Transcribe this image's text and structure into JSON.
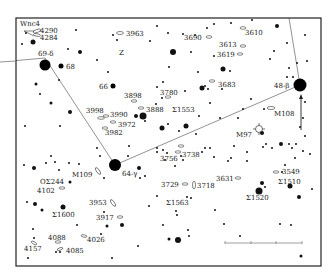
{
  "frame": {
    "x": 16,
    "y": 18,
    "w": 305,
    "h": 248
  },
  "constellation_lines": [
    {
      "from": "69-δ",
      "to": "64-γ",
      "points": [
        [
          0,
          62
        ],
        [
          45,
          58
        ],
        [
          115,
          165
        ]
      ]
    },
    {
      "from": "64-γ",
      "to": "48-β",
      "points": [
        [
          115,
          165
        ],
        [
          300,
          85
        ]
      ]
    },
    {
      "from": "48-β",
      "to": "top",
      "points": [
        [
          300,
          85
        ],
        [
          289,
          18
        ]
      ]
    }
  ],
  "named_stars": [
    {
      "label": "69-δ",
      "x": 45,
      "y": 65,
      "r": 5.5,
      "lx": 38,
      "ly": 56
    },
    {
      "label": "68",
      "x": 61,
      "y": 66,
      "r": 2.5,
      "lx": 66,
      "ly": 69
    },
    {
      "label": "66",
      "x": 113,
      "y": 86,
      "r": 2.5,
      "lx": 99,
      "ly": 89
    },
    {
      "label": "64-γ",
      "x": 115,
      "y": 165,
      "r": 6,
      "lx": 122,
      "ly": 176
    },
    {
      "label": "48-β",
      "x": 300,
      "y": 85,
      "r": 6.5,
      "lx": 274,
      "ly": 88
    }
  ],
  "labels": [
    {
      "text": "Wnc4",
      "x": 20,
      "y": 26
    },
    {
      "text": "4290",
      "x": 40,
      "y": 33
    },
    {
      "text": "4284",
      "x": 40,
      "y": 40
    },
    {
      "text": "3963",
      "x": 126,
      "y": 36
    },
    {
      "text": "Z",
      "x": 119,
      "y": 55
    },
    {
      "text": "3898",
      "x": 124,
      "y": 98
    },
    {
      "text": "3998",
      "x": 86,
      "y": 113
    },
    {
      "text": "3990",
      "x": 110,
      "y": 117
    },
    {
      "text": "3888",
      "x": 146,
      "y": 112
    },
    {
      "text": "3780",
      "x": 160,
      "y": 95
    },
    {
      "text": "Σ1553",
      "x": 172,
      "y": 112
    },
    {
      "text": "3972",
      "x": 118,
      "y": 127
    },
    {
      "text": "3982",
      "x": 105,
      "y": 135
    },
    {
      "text": "3690",
      "x": 184,
      "y": 40
    },
    {
      "text": "3610",
      "x": 245,
      "y": 35
    },
    {
      "text": "3613",
      "x": 219,
      "y": 47
    },
    {
      "text": "3619",
      "x": 217,
      "y": 57
    },
    {
      "text": "3683",
      "x": 218,
      "y": 87
    },
    {
      "text": "M108",
      "x": 274,
      "y": 116
    },
    {
      "text": "M97",
      "x": 236,
      "y": 137
    },
    {
      "text": "3738",
      "x": 182,
      "y": 157
    },
    {
      "text": "3756",
      "x": 160,
      "y": 161
    },
    {
      "text": "3729",
      "x": 161,
      "y": 187
    },
    {
      "text": "3718",
      "x": 197,
      "y": 188
    },
    {
      "text": "3631",
      "x": 216,
      "y": 181
    },
    {
      "text": "3549",
      "x": 282,
      "y": 174
    },
    {
      "text": "Σ1510",
      "x": 278,
      "y": 184
    },
    {
      "text": "Σ1520",
      "x": 246,
      "y": 200
    },
    {
      "text": "Σ1563",
      "x": 166,
      "y": 205
    },
    {
      "text": "M109",
      "x": 72,
      "y": 177
    },
    {
      "text": "OΣ244",
      "x": 40,
      "y": 184
    },
    {
      "text": "4102",
      "x": 37,
      "y": 193
    },
    {
      "text": "3953",
      "x": 89,
      "y": 205
    },
    {
      "text": "Σ1600",
      "x": 52,
      "y": 217
    },
    {
      "text": "3917",
      "x": 96,
      "y": 220
    },
    {
      "text": "4088",
      "x": 48,
      "y": 240
    },
    {
      "text": "4026",
      "x": 87,
      "y": 242
    },
    {
      "text": "4157",
      "x": 24,
      "y": 251
    },
    {
      "text": "4085",
      "x": 66,
      "y": 253
    }
  ],
  "galaxies": [
    {
      "x": 37,
      "y": 31,
      "rx": 4,
      "ry": 1.5,
      "rot": -20
    },
    {
      "x": 37,
      "y": 35,
      "rx": 3.5,
      "ry": 1.3,
      "rot": 10
    },
    {
      "x": 120,
      "y": 33,
      "rx": 3.5,
      "ry": 1.5,
      "rot": 0
    },
    {
      "x": 134,
      "y": 101,
      "rx": 3,
      "ry": 1.2,
      "rot": 0
    },
    {
      "x": 101,
      "y": 118,
      "rx": 3.5,
      "ry": 1.3,
      "rot": 0
    },
    {
      "x": 106,
      "y": 116,
      "rx": 3,
      "ry": 1.2,
      "rot": 0
    },
    {
      "x": 141,
      "y": 108,
      "rx": 3,
      "ry": 1.2,
      "rot": 0
    },
    {
      "x": 168,
      "y": 97,
      "rx": 3,
      "ry": 1.2,
      "rot": 0
    },
    {
      "x": 113,
      "y": 122,
      "rx": 3,
      "ry": 1.2,
      "rot": 0
    },
    {
      "x": 105,
      "y": 128,
      "rx": 3,
      "ry": 1.2,
      "rot": 0
    },
    {
      "x": 209,
      "y": 37,
      "rx": 3,
      "ry": 1.3,
      "rot": 0
    },
    {
      "x": 243,
      "y": 28,
      "rx": 3,
      "ry": 1.3,
      "rot": 0
    },
    {
      "x": 243,
      "y": 46,
      "rx": 3,
      "ry": 1.2,
      "rot": 0
    },
    {
      "x": 240,
      "y": 54,
      "rx": 3,
      "ry": 1.2,
      "rot": 0
    },
    {
      "x": 212,
      "y": 81,
      "rx": 3,
      "ry": 1.2,
      "rot": 0
    },
    {
      "x": 271,
      "y": 108,
      "rx": 4,
      "ry": 1.5,
      "rot": 0
    },
    {
      "x": 181,
      "y": 146,
      "rx": 3,
      "ry": 1.2,
      "rot": 0
    },
    {
      "x": 178,
      "y": 152,
      "rx": 3,
      "ry": 1.2,
      "rot": 0
    },
    {
      "x": 185,
      "y": 184,
      "rx": 3,
      "ry": 1.2,
      "rot": 0
    },
    {
      "x": 194,
      "y": 185,
      "rx": 1.5,
      "ry": 4,
      "rot": 0
    },
    {
      "x": 238,
      "y": 178,
      "rx": 3,
      "ry": 1.2,
      "rot": 0
    },
    {
      "x": 276,
      "y": 172,
      "rx": 3,
      "ry": 1.2,
      "rot": 0
    },
    {
      "x": 98,
      "y": 171,
      "rx": 4,
      "ry": 1.5,
      "rot": 55
    },
    {
      "x": 62,
      "y": 188,
      "rx": 3,
      "ry": 1.2,
      "rot": 0
    },
    {
      "x": 113,
      "y": 203,
      "rx": 4,
      "ry": 1.5,
      "rot": 55
    },
    {
      "x": 120,
      "y": 217,
      "rx": 3,
      "ry": 1.2,
      "rot": 0
    },
    {
      "x": 58,
      "y": 242,
      "rx": 3,
      "ry": 1.2,
      "rot": 0
    },
    {
      "x": 84,
      "y": 236,
      "rx": 3,
      "ry": 1.2,
      "rot": 10
    },
    {
      "x": 34,
      "y": 243,
      "rx": 3,
      "ry": 1.2,
      "rot": 30
    },
    {
      "x": 60,
      "y": 249,
      "rx": 3,
      "ry": 1.2,
      "rot": -20
    }
  ],
  "planetary_nebula": {
    "label": "M97",
    "x": 259,
    "y": 129,
    "r": 3.5
  },
  "stars": [
    [
      26,
      33,
      1
    ],
    [
      22,
      44,
      1
    ],
    [
      33,
      42,
      2.5
    ],
    [
      76,
      30,
      1
    ],
    [
      113,
      35,
      1
    ],
    [
      117,
      40,
      1
    ],
    [
      157,
      26,
      1
    ],
    [
      68,
      49,
      1
    ],
    [
      80,
      52,
      2
    ],
    [
      97,
      60,
      1
    ],
    [
      108,
      72,
      1
    ],
    [
      36,
      84,
      1.5
    ],
    [
      59,
      80,
      1
    ],
    [
      40,
      94,
      1
    ],
    [
      51,
      103,
      1.5
    ],
    [
      70,
      112,
      2
    ],
    [
      25,
      126,
      1
    ],
    [
      60,
      126,
      1
    ],
    [
      136,
      116,
      2
    ],
    [
      143,
      116,
      3.5
    ],
    [
      145,
      121,
      1
    ],
    [
      162,
      128,
      2.5
    ],
    [
      168,
      124,
      1
    ],
    [
      156,
      104,
      1
    ],
    [
      162,
      98,
      1
    ],
    [
      183,
      34,
      1
    ],
    [
      195,
      35,
      1
    ],
    [
      207,
      28,
      1
    ],
    [
      214,
      24,
      1
    ],
    [
      231,
      23,
      1
    ],
    [
      214,
      56,
      1
    ],
    [
      168,
      33,
      1
    ],
    [
      191,
      52,
      1
    ],
    [
      173,
      52,
      3
    ],
    [
      150,
      41,
      1
    ],
    [
      163,
      82,
      1
    ],
    [
      157,
      87,
      1
    ],
    [
      185,
      91,
      1
    ],
    [
      222,
      89,
      1
    ],
    [
      169,
      67,
      1
    ],
    [
      205,
      86,
      1
    ],
    [
      202,
      88,
      2.5
    ],
    [
      208,
      89,
      1
    ],
    [
      198,
      72,
      1
    ],
    [
      223,
      69,
      2.5
    ],
    [
      230,
      71,
      1
    ],
    [
      210,
      103,
      1
    ],
    [
      220,
      118,
      1
    ],
    [
      251,
      99,
      1
    ],
    [
      243,
      109,
      1
    ],
    [
      264,
      109,
      1
    ],
    [
      238,
      118,
      1
    ],
    [
      262,
      133,
      2
    ],
    [
      266,
      144,
      1
    ],
    [
      272,
      148,
      1
    ],
    [
      263,
      147,
      1
    ],
    [
      281,
      144,
      2
    ],
    [
      289,
      144,
      1
    ],
    [
      296,
      144,
      1
    ],
    [
      300,
      127,
      1
    ],
    [
      307,
      61,
      1
    ],
    [
      305,
      35,
      1
    ],
    [
      252,
      20,
      1
    ],
    [
      277,
      26,
      2
    ],
    [
      287,
      43,
      1
    ],
    [
      270,
      59,
      1
    ],
    [
      274,
      51,
      1
    ],
    [
      289,
      68,
      1
    ],
    [
      287,
      77,
      1
    ],
    [
      293,
      77,
      1
    ],
    [
      297,
      63,
      1
    ],
    [
      305,
      102,
      1
    ],
    [
      303,
      118,
      1
    ],
    [
      305,
      136,
      1
    ],
    [
      310,
      154,
      1
    ],
    [
      282,
      172,
      1
    ],
    [
      285,
      165,
      1
    ],
    [
      295,
      158,
      1
    ],
    [
      292,
      148,
      1
    ],
    [
      303,
      151,
      1
    ],
    [
      262,
      183,
      2
    ],
    [
      265,
      187,
      1
    ],
    [
      259,
      191,
      3.5
    ],
    [
      290,
      186,
      2.5
    ],
    [
      312,
      189,
      1
    ],
    [
      299,
      197,
      2
    ],
    [
      247,
      161,
      1
    ],
    [
      214,
      157,
      1
    ],
    [
      205,
      148,
      1
    ],
    [
      202,
      152,
      1
    ],
    [
      210,
      148,
      1
    ],
    [
      196,
      134,
      1
    ],
    [
      186,
      126,
      2.5
    ],
    [
      179,
      131,
      1
    ],
    [
      199,
      116,
      1
    ],
    [
      157,
      148,
      1
    ],
    [
      157,
      152,
      1
    ],
    [
      163,
      150,
      1
    ],
    [
      167,
      153,
      1
    ],
    [
      165,
      160,
      1
    ],
    [
      183,
      160,
      1
    ],
    [
      175,
      166,
      1
    ],
    [
      181,
      156,
      1
    ],
    [
      139,
      168,
      2
    ],
    [
      140,
      178,
      1
    ],
    [
      145,
      176,
      1
    ],
    [
      129,
      146,
      1
    ],
    [
      128,
      156,
      1
    ],
    [
      51,
      156,
      1
    ],
    [
      59,
      170,
      1
    ],
    [
      79,
      164,
      1
    ],
    [
      97,
      148,
      1
    ],
    [
      100,
      156,
      1
    ],
    [
      34,
      168,
      2
    ],
    [
      24,
      165,
      1
    ],
    [
      46,
      163,
      1
    ],
    [
      55,
      162,
      1
    ],
    [
      69,
      163,
      1
    ],
    [
      104,
      178,
      1
    ],
    [
      70,
      182,
      1.5
    ],
    [
      27,
      202,
      1
    ],
    [
      35,
      204,
      2
    ],
    [
      42,
      210,
      1.5
    ],
    [
      63,
      207,
      2.5
    ],
    [
      77,
      225,
      1
    ],
    [
      104,
      212,
      1
    ],
    [
      122,
      225,
      2
    ],
    [
      149,
      206,
      1
    ],
    [
      157,
      196,
      1
    ],
    [
      176,
      211,
      1
    ],
    [
      177,
      215,
      1
    ],
    [
      163,
      225,
      1
    ],
    [
      169,
      239,
      1.5
    ],
    [
      178,
      240,
      3
    ],
    [
      187,
      197,
      1
    ],
    [
      191,
      198,
      1
    ],
    [
      215,
      210,
      1
    ],
    [
      224,
      224,
      1
    ],
    [
      240,
      236,
      1
    ],
    [
      280,
      224,
      1
    ],
    [
      291,
      225,
      1
    ],
    [
      301,
      256,
      1.5
    ],
    [
      188,
      230,
      1
    ],
    [
      189,
      236,
      1
    ],
    [
      33,
      229,
      1
    ],
    [
      34,
      238,
      1
    ],
    [
      101,
      234,
      1
    ],
    [
      107,
      226,
      1.5
    ],
    [
      138,
      246,
      1
    ],
    [
      28,
      258,
      1
    ],
    [
      56,
      252,
      1
    ],
    [
      60,
      252,
      1
    ],
    [
      112,
      258,
      1
    ],
    [
      228,
      161,
      1
    ],
    [
      231,
      158,
      1
    ],
    [
      234,
      146,
      1
    ],
    [
      247,
      152,
      1
    ]
  ],
  "arrow": {
    "x": 301,
    "y1": 130,
    "y2": 94
  },
  "scale_bar": {
    "x1": 225,
    "x2": 302,
    "y": 243,
    "ticks": [
      225,
      251,
      276,
      302
    ]
  }
}
